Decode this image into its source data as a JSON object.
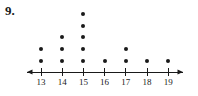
{
  "figure": {
    "problem_number": "9.",
    "type": "dot-plot",
    "background_color": "#ffffff",
    "ink_color": "#1a1a1a"
  },
  "axis": {
    "orientation": "horizontal",
    "left_arrow": true,
    "right_arrow": true,
    "tick_labels": [
      "13",
      "14",
      "15",
      "16",
      "17",
      "18",
      "19"
    ]
  },
  "chart_data": {
    "type": "scatter",
    "subtype": "dot-plot",
    "title": "",
    "xlabel": "",
    "ylabel": "",
    "categories": [
      13,
      14,
      15,
      16,
      17,
      18,
      19
    ],
    "values": [
      2,
      3,
      5,
      1,
      2,
      1,
      1
    ],
    "tick_labels": [
      "13",
      "14",
      "15",
      "16",
      "17",
      "18",
      "19"
    ],
    "xlim": [
      12.3,
      19.7
    ],
    "ylim": [
      0,
      5
    ],
    "grid": false,
    "legend": null,
    "total_count": 15
  },
  "geometry": {
    "axis_y": 72,
    "axis_x_start": 27,
    "axis_x_end": 183,
    "first_tick_x": 41,
    "tick_spacing": 21.2,
    "tick_half_height": 4,
    "dot_base_y": 61,
    "dot_spacing": 11.8,
    "dot_radius": 2,
    "label_y": 78
  }
}
